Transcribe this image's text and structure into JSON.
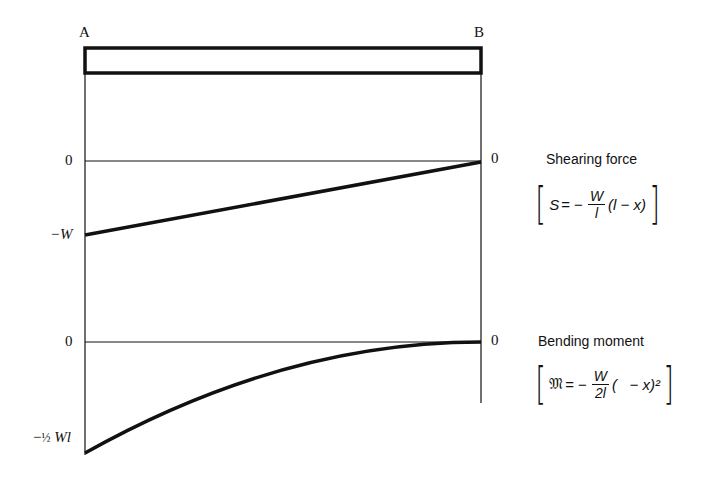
{
  "beam": {
    "left_label": "A",
    "right_label": "B"
  },
  "shear_diagram": {
    "title": "Shearing force",
    "zero_left": "0",
    "zero_right": "0",
    "min_label": "−W",
    "formula": {
      "lhs": "S",
      "eq": "= −",
      "num": "W",
      "den": "l",
      "rest": "(l − x)"
    }
  },
  "moment_diagram": {
    "title": "Bending moment",
    "zero_left": "0",
    "zero_right": "0",
    "min_label_prefix": "−",
    "min_label_frac": "½",
    "min_label_suffix": "Wl",
    "formula": {
      "lhs": "𝔐",
      "eq": "= −",
      "num": "W",
      "den": "2l",
      "rest": "(   − x)²"
    }
  }
}
